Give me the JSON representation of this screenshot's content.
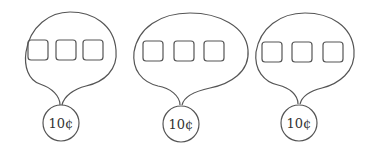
{
  "diagram": {
    "groups": [
      {
        "label": "10¢",
        "boxes": 3
      },
      {
        "label": "10¢",
        "boxes": 3
      },
      {
        "label": "10¢",
        "boxes": 3
      }
    ],
    "colors": {
      "stroke": "#555555",
      "background": "#ffffff"
    }
  }
}
